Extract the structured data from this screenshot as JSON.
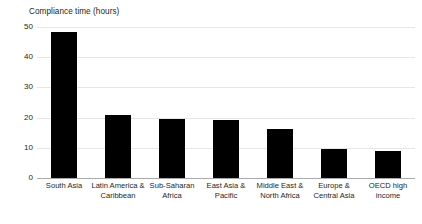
{
  "chart_data": {
    "type": "bar",
    "title": "Compliance time (hours)",
    "xlabel": "",
    "ylabel": "Compliance time (hours)",
    "ylim": [
      0,
      50
    ],
    "yticks": [
      0,
      10,
      20,
      30,
      40,
      50
    ],
    "grid": true,
    "legend": null,
    "bar_color": "#000000",
    "gridline_color": "#e6e6e6",
    "axis_color": "#a7a9ac",
    "text_color": "#231f20",
    "background": "#ffffff",
    "categories": [
      "South Asia",
      "Latin America & Caribbean",
      "Sub-Saharan Africa",
      "East Asia & Pacific",
      "Middle East & North Africa",
      "Europe & Central Asia",
      "OECD high income"
    ],
    "category_lines": [
      [
        "South Asia"
      ],
      [
        "Latin America &",
        "Caribbean"
      ],
      [
        "Sub-Saharan",
        "Africa"
      ],
      [
        "East Asia &",
        "Pacific"
      ],
      [
        "Middle East &",
        "North Africa"
      ],
      [
        "Europe &",
        "Central Asia"
      ],
      [
        "OECD high",
        "income"
      ]
    ],
    "values": [
      48.3,
      20.9,
      19.6,
      19.1,
      16.2,
      9.5,
      9.0
    ]
  }
}
